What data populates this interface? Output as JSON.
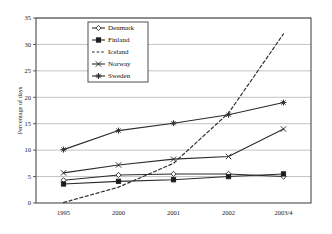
{
  "chart_data": {
    "type": "line",
    "title": "",
    "xlabel": "",
    "ylabel": "Percentage of days",
    "categories": [
      "1995",
      "2000",
      "2001",
      "2002",
      "2003/4"
    ],
    "ylim": [
      0,
      35
    ],
    "yticks": [
      0,
      5,
      10,
      15,
      20,
      25,
      30,
      35
    ],
    "grid": true,
    "legend_position": "upper-left-inside",
    "series": [
      {
        "name": "Denmark",
        "marker": "open-diamond",
        "linestyle": "solid",
        "values": [
          4.3,
          5.3,
          5.5,
          5.5,
          5.0
        ]
      },
      {
        "name": "Finland",
        "marker": "filled-square",
        "linestyle": "solid",
        "values": [
          3.6,
          4.1,
          4.4,
          5.0,
          5.5
        ]
      },
      {
        "name": "Iceland",
        "marker": "none",
        "linestyle": "dashed",
        "values": [
          0.1,
          3.0,
          7.5,
          17.0,
          32.0
        ]
      },
      {
        "name": "Norway",
        "marker": "cross",
        "linestyle": "solid",
        "values": [
          5.7,
          7.2,
          8.3,
          8.8,
          14.0
        ]
      },
      {
        "name": "Sweden",
        "marker": "asterisk",
        "linestyle": "solid",
        "values": [
          10.1,
          13.7,
          15.1,
          16.7,
          19.0
        ]
      }
    ]
  },
  "yaxis": {
    "labels": [
      "0",
      "5",
      "10",
      "15",
      "20",
      "25",
      "30",
      "35"
    ],
    "title": "Percentage of days"
  },
  "xaxis": {
    "labels": [
      "1995",
      "2000",
      "2001",
      "2002",
      "2003/4"
    ]
  },
  "legend": {
    "entries": [
      {
        "label": "Denmark"
      },
      {
        "label": "Finland"
      },
      {
        "label": "Iceland"
      },
      {
        "label": "Norway"
      },
      {
        "label": "Sweden"
      }
    ]
  },
  "colors": {
    "line": "#2b2b2b",
    "grid": "#a8a8a8",
    "frame": "#4a4a4a",
    "background": "#ffffff"
  }
}
